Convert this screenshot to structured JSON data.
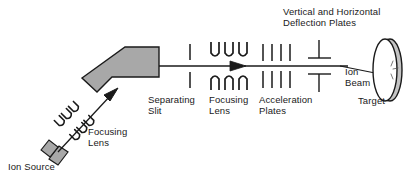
{
  "figure": {
    "background_color": "#ffffff",
    "stroke_color": "#1a1a1a",
    "fill_gray": "#a8a8a8",
    "text_color": "#1a1a1a"
  },
  "labels": {
    "ion_source": "Ion Source",
    "focusing_lens_1": "Focusing\nLens",
    "separating_slit": "Separating\nSlit",
    "focusing_lens_2": "Focusing\nLens",
    "acceleration_plates": "Acceleration\nPlates",
    "deflection_plates": "Vertical and Horizontal\nDeflection Plates",
    "ion_beam": "Ion\nBeam",
    "target": "Target"
  },
  "components": [
    {
      "name": "ion-source",
      "label": "Ion Source",
      "shape": "angled-bar-with-crossbar",
      "fill": "#a8a8a8",
      "x": 58,
      "y": 148
    },
    {
      "name": "focusing-lens-1",
      "label": "Focusing Lens",
      "shape": "arc-pairs",
      "arc_count": 3,
      "orientation": "diagonal",
      "x": 76,
      "y": 120
    },
    {
      "name": "mass-analyzer-magnet",
      "label": "",
      "shape": "bent-polygon",
      "fill": "#a8a8a8",
      "x": 118,
      "y": 66
    },
    {
      "name": "separating-slit",
      "label": "Separating Slit",
      "shape": "vertical-tick-pair",
      "x": 190,
      "y": 66
    },
    {
      "name": "focusing-lens-2",
      "label": "Focusing Lens",
      "shape": "arc-pairs",
      "arc_count": 3,
      "orientation": "horizontal",
      "x": 228,
      "y": 66
    },
    {
      "name": "acceleration-plates",
      "label": "Acceleration Plates",
      "shape": "vertical-line-bank",
      "line_count": 4,
      "x": 276,
      "y": 66
    },
    {
      "name": "deflection-plates",
      "label": "Vertical and Horizontal Deflection Plates",
      "shape": "t-plate-pair",
      "x": 319,
      "y": 66
    },
    {
      "name": "target",
      "label": "Target",
      "shape": "disc",
      "x": 383,
      "y": 69
    },
    {
      "name": "ion-beam",
      "label": "Ion Beam",
      "shape": "arrow-line",
      "x": 350,
      "y": 72
    }
  ]
}
